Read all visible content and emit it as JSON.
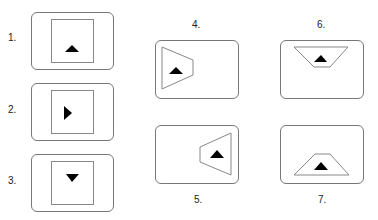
{
  "figures": [
    {
      "label": "1.",
      "description": "square with upward triangle"
    },
    {
      "label": "2.",
      "description": "square with right-pointing triangle"
    },
    {
      "label": "3.",
      "description": "square with downward triangle"
    },
    {
      "label": "4.",
      "description": "trapezoid on left side with upward triangle"
    },
    {
      "label": "5.",
      "description": "trapezoid on right side with upward triangle"
    },
    {
      "label": "6.",
      "description": "inverted trapezoid at top with upward triangle"
    },
    {
      "label": "7.",
      "description": "trapezoid at bottom with upward triangle"
    }
  ],
  "colors": {
    "frame": "#777777",
    "inner": "#888888",
    "triangle": "#000000"
  }
}
